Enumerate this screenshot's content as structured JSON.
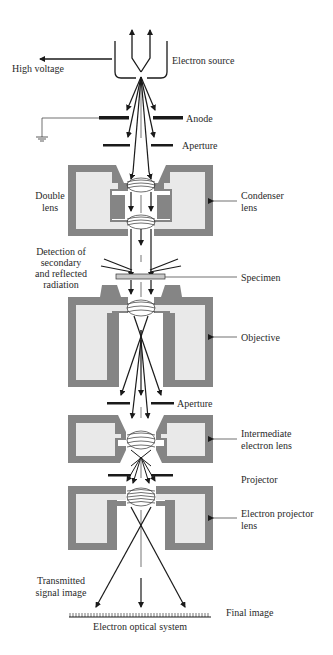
{
  "diagram": {
    "title": "Electron optical system",
    "colors": {
      "housing": "#858585",
      "housing_inner": "#e9e9e9",
      "lines": "#1a1a1a",
      "text": "#2a2a2a"
    },
    "labels": {
      "electron_source": "Electron source",
      "high_voltage": "High voltage",
      "anode": "Anode",
      "aperture_top": "Aperture",
      "double_lens_1": "Double",
      "double_lens_2": "lens",
      "condenser_lens_1": "Condenser",
      "condenser_lens_2": "lens",
      "detection_1": "Detection of",
      "detection_2": "secondary",
      "detection_3": "and reflected",
      "detection_4": "radiation",
      "specimen": "Specimen",
      "objective": "Objective",
      "aperture_mid": "Aperture",
      "intermediate_1": "Intermediate",
      "intermediate_2": "electron lens",
      "projector": "Projector",
      "projector_lens_1": "Electron projector",
      "projector_lens_2": "lens",
      "transmitted_1": "Transmitted",
      "transmitted_2": "signal image",
      "final_image": "Final image",
      "system_caption": "Electron optical system"
    },
    "components": [
      "Electron source",
      "Anode",
      "Aperture",
      "Condenser lens (double lens)",
      "Specimen",
      "Objective",
      "Aperture",
      "Intermediate electron lens",
      "Projector",
      "Electron projector lens",
      "Final image"
    ]
  }
}
